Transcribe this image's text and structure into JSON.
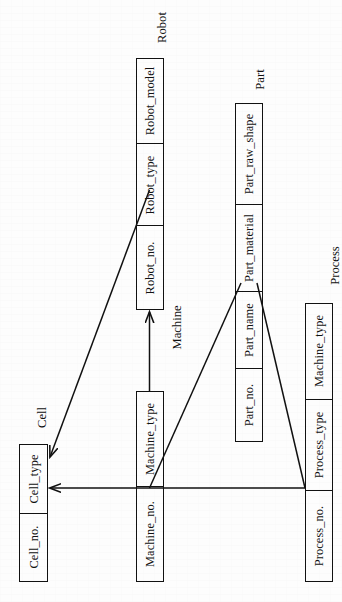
{
  "diagram": {
    "orientation": "rotated-90",
    "stroke_color": "#111111",
    "background_color": "#fdfdfd",
    "entities": [
      {
        "id": "robot",
        "name": "Robot",
        "attributes": [
          "Robot_no.",
          "Robot_type",
          "Robot_model"
        ]
      },
      {
        "id": "part",
        "name": "Part",
        "attributes": [
          "Part_no.",
          "Part_name",
          "Part_material",
          "Part_raw_shape"
        ]
      },
      {
        "id": "machine",
        "name": "Machine",
        "attributes": [
          "Machine_no.",
          "Machine_type"
        ]
      },
      {
        "id": "process",
        "name": "Process",
        "attributes": [
          "Process_no.",
          "Process_type",
          "Machine_type"
        ]
      },
      {
        "id": "cell",
        "name": "Cell",
        "attributes": [
          "Cell_no.",
          "Cell_type"
        ]
      }
    ],
    "relations": [
      {
        "id": "machine-to-robot",
        "from": "machine",
        "to": "robot",
        "style": "arrow"
      },
      {
        "id": "machine-to-cell",
        "from": "machine",
        "to": "cell",
        "style": "arrow"
      },
      {
        "id": "process-to-cell",
        "from": "process",
        "to": "cell",
        "style": "arrow"
      },
      {
        "id": "machine-to-part",
        "from": "machine",
        "to": "part",
        "style": "line"
      },
      {
        "id": "process-to-part",
        "from": "process",
        "to": "part",
        "style": "line"
      }
    ]
  }
}
